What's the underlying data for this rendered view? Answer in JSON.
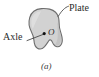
{
  "figure": {
    "caption": "(a)",
    "background_color": "#ffffff",
    "plate": {
      "label": "Plate",
      "fill_color": "#d2d2d2",
      "stroke_color": "#6e6e6e",
      "highlight_color": "#e4e4e4",
      "shadow_color": "#b4b4b4"
    },
    "axle": {
      "label": "Axle",
      "point_label": "O",
      "point_color": "#101010"
    },
    "leader_line_color": "#4a4a4a"
  }
}
